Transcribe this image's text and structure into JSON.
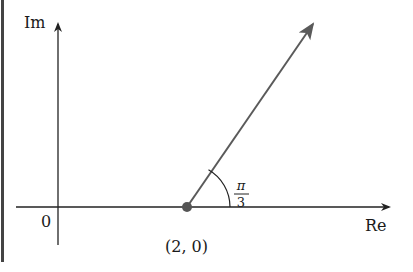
{
  "diagram": {
    "axes": {
      "vertical_label": "Im",
      "horizontal_label": "Re",
      "origin_label": "0"
    },
    "point": {
      "label": "(2, 0)",
      "color": "#555555"
    },
    "angle": {
      "numerator": "π",
      "denominator": "3"
    },
    "colors": {
      "axis": "#222222",
      "ray": "#5a5a5a",
      "border": "#444444"
    }
  }
}
